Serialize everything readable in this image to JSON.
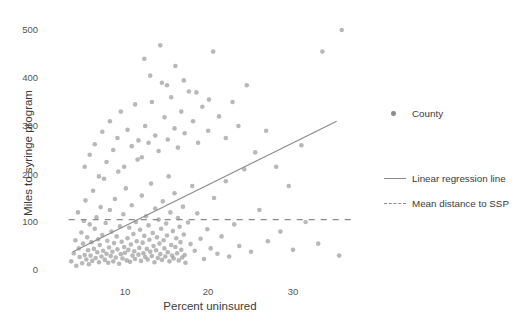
{
  "chart_data": {
    "type": "scatter",
    "title": "",
    "xlabel": "Percent uninsured",
    "ylabel": "Miles to syringe program",
    "xlim": [
      2,
      38
    ],
    "ylim": [
      -20,
      530
    ],
    "xticks": [
      10,
      20,
      30
    ],
    "yticks": [
      0,
      100,
      200,
      300,
      400,
      500
    ],
    "grid": false,
    "legend_position": "right",
    "series": [
      {
        "name": "County",
        "type": "scatter",
        "marker": "circle",
        "color": "#8d8d8d",
        "points": [
          [
            3.6,
            18
          ],
          [
            3.9,
            35
          ],
          [
            4.1,
            62
          ],
          [
            4.2,
            9
          ],
          [
            4.4,
            120
          ],
          [
            4.5,
            45
          ],
          [
            4.6,
            27
          ],
          [
            4.8,
            78
          ],
          [
            4.9,
            14
          ],
          [
            5.0,
            55
          ],
          [
            5.1,
            102
          ],
          [
            5.2,
            31
          ],
          [
            5.3,
            145
          ],
          [
            5.4,
            22
          ],
          [
            5.5,
            68
          ],
          [
            5.6,
            41
          ],
          [
            5.7,
            12
          ],
          [
            5.8,
            95
          ],
          [
            5.9,
            30
          ],
          [
            6.0,
            58
          ],
          [
            6.1,
            19
          ],
          [
            6.2,
            165
          ],
          [
            6.3,
            44
          ],
          [
            6.4,
            86
          ],
          [
            6.5,
            25
          ],
          [
            6.6,
            110
          ],
          [
            6.7,
            37
          ],
          [
            6.8,
            64
          ],
          [
            6.9,
            16
          ],
          [
            7.0,
            52
          ],
          [
            7.1,
            131
          ],
          [
            7.2,
            28
          ],
          [
            7.3,
            73
          ],
          [
            7.4,
            40
          ],
          [
            7.5,
            190
          ],
          [
            7.6,
            21
          ],
          [
            7.7,
            98
          ],
          [
            7.8,
            34
          ],
          [
            7.9,
            61
          ],
          [
            8.0,
            15
          ],
          [
            8.1,
            47
          ],
          [
            8.2,
            125
          ],
          [
            8.3,
            29
          ],
          [
            8.4,
            80
          ],
          [
            8.5,
            38
          ],
          [
            8.6,
            18
          ],
          [
            8.7,
            56
          ],
          [
            8.8,
            148
          ],
          [
            8.9,
            26
          ],
          [
            9.0,
            70
          ],
          [
            9.1,
            43
          ],
          [
            9.2,
            205
          ],
          [
            9.3,
            13
          ],
          [
            9.4,
            91
          ],
          [
            9.5,
            33
          ],
          [
            9.6,
            59
          ],
          [
            9.7,
            24
          ],
          [
            9.8,
            116
          ],
          [
            9.9,
            48
          ],
          [
            10.0,
            36
          ],
          [
            10.1,
            170
          ],
          [
            10.2,
            20
          ],
          [
            10.3,
            66
          ],
          [
            10.4,
            42
          ],
          [
            10.5,
            88
          ],
          [
            10.6,
            17
          ],
          [
            10.7,
            53
          ],
          [
            10.8,
            135
          ],
          [
            10.9,
            30
          ],
          [
            11.0,
            75
          ],
          [
            11.1,
            39
          ],
          [
            11.2,
            23
          ],
          [
            11.3,
            100
          ],
          [
            11.4,
            60
          ],
          [
            11.5,
            230
          ],
          [
            11.6,
            32
          ],
          [
            11.7,
            46
          ],
          [
            11.8,
            84
          ],
          [
            11.9,
            19
          ],
          [
            12.0,
            155
          ],
          [
            12.1,
            57
          ],
          [
            12.2,
            35
          ],
          [
            12.3,
            71
          ],
          [
            12.4,
            27
          ],
          [
            12.5,
            112
          ],
          [
            12.6,
            44
          ],
          [
            12.7,
            22
          ],
          [
            12.8,
            93
          ],
          [
            12.9,
            63
          ],
          [
            13.0,
            38
          ],
          [
            13.1,
            180
          ],
          [
            13.2,
            29
          ],
          [
            13.3,
            77
          ],
          [
            13.4,
            50
          ],
          [
            13.5,
            16
          ],
          [
            13.6,
            128
          ],
          [
            13.7,
            41
          ],
          [
            13.8,
            68
          ],
          [
            13.9,
            25
          ],
          [
            14.0,
            105
          ],
          [
            14.1,
            55
          ],
          [
            14.2,
            33
          ],
          [
            14.3,
            86
          ],
          [
            14.4,
            21
          ],
          [
            14.5,
            143
          ],
          [
            14.6,
            62
          ],
          [
            14.7,
            45
          ],
          [
            14.8,
            28
          ],
          [
            14.9,
            97
          ],
          [
            15.0,
            72
          ],
          [
            15.1,
            37
          ],
          [
            15.2,
            195
          ],
          [
            15.3,
            18
          ],
          [
            15.4,
            120
          ],
          [
            15.5,
            52
          ],
          [
            15.6,
            30
          ],
          [
            15.7,
            81
          ],
          [
            15.8,
            24
          ],
          [
            15.9,
            160
          ],
          [
            16.0,
            48
          ],
          [
            16.1,
            66
          ],
          [
            16.2,
            35
          ],
          [
            16.3,
            108
          ],
          [
            16.4,
            20
          ],
          [
            16.5,
            90
          ],
          [
            16.6,
            58
          ],
          [
            16.7,
            42
          ],
          [
            16.8,
            26
          ],
          [
            16.9,
            132
          ],
          [
            17.0,
            74
          ],
          [
            17.1,
            31
          ],
          [
            17.2,
            15
          ],
          [
            17.5,
            99
          ],
          [
            17.8,
            54
          ],
          [
            18.0,
            175
          ],
          [
            18.3,
            40
          ],
          [
            18.6,
            118
          ],
          [
            19.0,
            65
          ],
          [
            19.4,
            23
          ],
          [
            19.8,
            85
          ],
          [
            20.2,
            45
          ],
          [
            20.6,
            150
          ],
          [
            21.0,
            34
          ],
          [
            21.5,
            70
          ],
          [
            22.0,
            185
          ],
          [
            22.4,
            28
          ],
          [
            23.0,
            95
          ],
          [
            23.6,
            50
          ],
          [
            24.2,
            210
          ],
          [
            25.0,
            38
          ],
          [
            26.0,
            125
          ],
          [
            27.0,
            60
          ],
          [
            28.5,
            80
          ],
          [
            30.0,
            42
          ],
          [
            31.5,
            100
          ],
          [
            33.0,
            55
          ],
          [
            35.5,
            30
          ],
          [
            5.2,
            215
          ],
          [
            5.8,
            240
          ],
          [
            6.4,
            262
          ],
          [
            6.9,
            195
          ],
          [
            7.3,
            288
          ],
          [
            7.8,
            225
          ],
          [
            8.2,
            310
          ],
          [
            8.6,
            250
          ],
          [
            9.1,
            275
          ],
          [
            9.5,
            330
          ],
          [
            9.9,
            215
          ],
          [
            10.3,
            292
          ],
          [
            10.8,
            258
          ],
          [
            11.2,
            345
          ],
          [
            11.6,
            270
          ],
          [
            12.0,
            235
          ],
          [
            12.4,
            300
          ],
          [
            12.8,
            265
          ],
          [
            13.2,
            350
          ],
          [
            13.6,
            280
          ],
          [
            14.0,
            248
          ],
          [
            14.4,
            390
          ],
          [
            14.7,
            318
          ],
          [
            15.1,
            272
          ],
          [
            15.5,
            360
          ],
          [
            15.9,
            295
          ],
          [
            16.3,
            255
          ],
          [
            16.7,
            330
          ],
          [
            17.1,
            285
          ],
          [
            17.6,
            372
          ],
          [
            18.1,
            310
          ],
          [
            18.7,
            265
          ],
          [
            19.2,
            340
          ],
          [
            19.9,
            290
          ],
          [
            20.5,
            455
          ],
          [
            21.2,
            320
          ],
          [
            22.0,
            275
          ],
          [
            22.8,
            350
          ],
          [
            23.5,
            300
          ],
          [
            24.5,
            385
          ],
          [
            25.5,
            245
          ],
          [
            26.8,
            290
          ],
          [
            28.0,
            215
          ],
          [
            29.5,
            175
          ],
          [
            31.0,
            260
          ],
          [
            33.5,
            455
          ],
          [
            35.8,
            500
          ],
          [
            12.3,
            440
          ],
          [
            13.0,
            405
          ],
          [
            14.2,
            468
          ],
          [
            15.0,
            385
          ],
          [
            16.0,
            425
          ],
          [
            17.0,
            395
          ],
          [
            18.5,
            370
          ],
          [
            20.0,
            355
          ]
        ]
      }
    ],
    "lines": [
      {
        "name": "Linear regression line",
        "style": "solid",
        "color": "#8b8b8b",
        "x0": 3.8,
        "y0": 38,
        "x1": 35.2,
        "y1": 310
      },
      {
        "name": "Mean distance to SSP",
        "style": "dashed",
        "color": "#8b8b8b",
        "value": 105,
        "x0": 3.3,
        "x1": 37.0
      }
    ]
  },
  "axes": {
    "x": {
      "label": "Percent uninsured",
      "ticks": [
        "10",
        "20",
        "30"
      ]
    },
    "y": {
      "label": "Miles to syringe program",
      "ticks": [
        "500",
        "400",
        "300",
        "200",
        "100",
        "0"
      ]
    }
  },
  "legend": {
    "items": [
      {
        "label": "County",
        "key": "dot"
      },
      {
        "label": "Linear regression line",
        "key": "solid-line"
      },
      {
        "label": "Mean distance to SSP",
        "key": "dashed-line"
      }
    ]
  },
  "colors": {
    "point": "#8d8d8d",
    "line": "#8b8b8b",
    "text": "#3b3b3b",
    "background": "#ffffff"
  }
}
